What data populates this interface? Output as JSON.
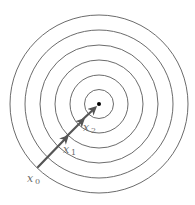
{
  "diagram": {
    "center": {
      "x": 99,
      "y": 104
    },
    "rings": [
      14.5,
      29,
      44,
      59,
      74,
      89
    ],
    "colors": {
      "ring": "#5a5a5a",
      "arrow": "#555555",
      "label": "#6a6a6a",
      "center": "#000000"
    },
    "points": [
      {
        "id": "x0",
        "var": "x",
        "sub": "0",
        "x": 38,
        "y": 167
      },
      {
        "id": "x1",
        "var": "x",
        "sub": "1",
        "x": 66,
        "y": 137
      },
      {
        "id": "x2",
        "var": "x",
        "sub": "2",
        "x": 81,
        "y": 121
      }
    ],
    "labels": {
      "x0": {
        "var": "x",
        "sub": "0"
      },
      "x1": {
        "var": "x",
        "sub": "1"
      },
      "x2": {
        "var": "x",
        "sub": "2"
      }
    },
    "minimum_marker": "center-dot"
  }
}
